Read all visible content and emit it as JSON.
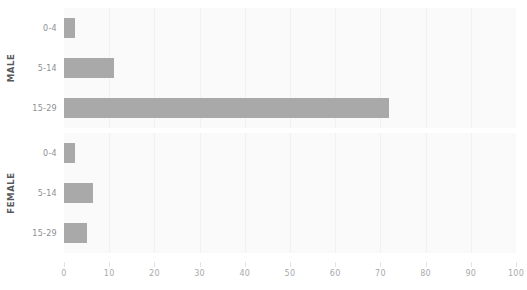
{
  "chart_data": {
    "type": "bar",
    "orientation": "horizontal",
    "title": "",
    "xlabel": "",
    "ylabel": "",
    "xlim": [
      0,
      100
    ],
    "xticks": [
      0,
      10,
      20,
      30,
      40,
      50,
      60,
      70,
      80,
      90,
      100
    ],
    "xtick_labels": [
      "0",
      "10",
      "20",
      "30",
      "40",
      "50",
      "60",
      "70",
      "80",
      "90",
      "100"
    ],
    "grid": true,
    "grid_axis": "x",
    "legend": false,
    "categories": [
      "0-4",
      "5-14",
      "15-29"
    ],
    "facets": [
      {
        "name": "MALE",
        "label": "MALE",
        "categories": [
          "0-4",
          "5-14",
          "15-29"
        ],
        "values": [
          2.5,
          11,
          72
        ]
      },
      {
        "name": "FEMALE",
        "label": "FEMALE",
        "categories": [
          "0-4",
          "5-14",
          "15-29"
        ],
        "values": [
          2.5,
          6.5,
          5
        ]
      }
    ],
    "colors": {
      "bar": "#a9a9a9",
      "panel_background": "#fafafa",
      "gridline": "#f1f1f1",
      "tick_label": "#a8aaad",
      "category_label": "#8d8f92",
      "facet_label": "#58595b"
    }
  }
}
